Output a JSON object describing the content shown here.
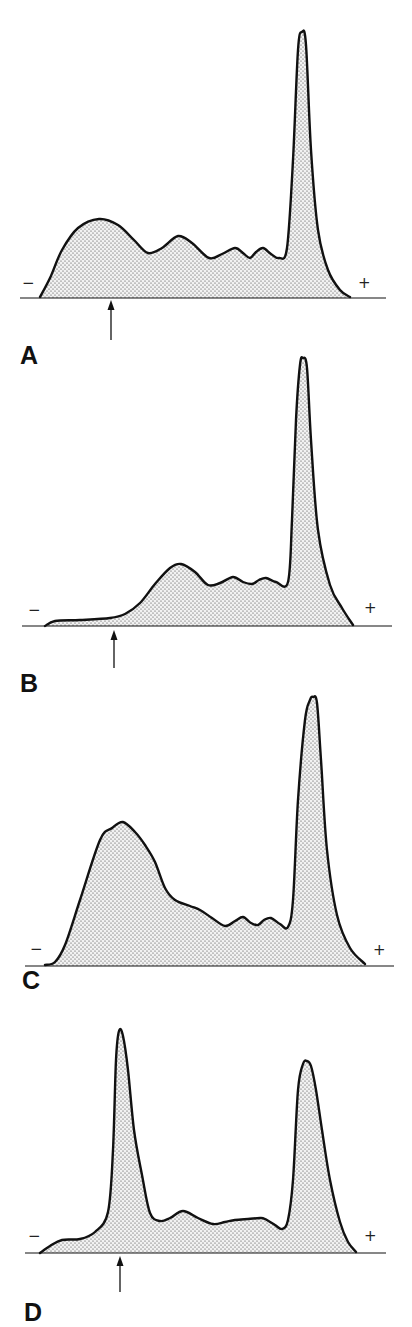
{
  "figure": {
    "type": "electrophoresis-densitometry-tracings",
    "stroke_color": "#111111",
    "fill_dot_color": "#3a3a3a",
    "background": "#ffffff",
    "panels": [
      {
        "label": "A",
        "label_pos": [
          20,
          343
        ],
        "baseline": {
          "y": 298,
          "x1": 20,
          "x2": 386
        },
        "minus": {
          "text": "−",
          "pos": [
            22,
            276
          ]
        },
        "plus": {
          "text": "+",
          "pos": [
            358,
            276
          ]
        },
        "arrow": {
          "x": 111,
          "y_top": 300,
          "y_bottom": 340
        },
        "curve": [
          [
            40,
            297
          ],
          [
            50,
            278
          ],
          [
            62,
            250
          ],
          [
            78,
            228
          ],
          [
            99,
            219
          ],
          [
            118,
            225
          ],
          [
            134,
            240
          ],
          [
            148,
            253
          ],
          [
            162,
            248
          ],
          [
            178,
            236
          ],
          [
            192,
            243
          ],
          [
            209,
            258
          ],
          [
            222,
            254
          ],
          [
            235,
            248
          ],
          [
            243,
            253
          ],
          [
            250,
            258
          ],
          [
            256,
            252
          ],
          [
            263,
            248
          ],
          [
            271,
            254
          ],
          [
            279,
            258
          ],
          [
            287,
            248
          ],
          [
            293,
            160
          ],
          [
            298,
            50
          ],
          [
            302,
            32
          ],
          [
            306,
            45
          ],
          [
            311,
            150
          ],
          [
            318,
            230
          ],
          [
            328,
            270
          ],
          [
            340,
            290
          ],
          [
            350,
            297
          ]
        ]
      },
      {
        "label": "B",
        "label_pos": [
          20,
          671
        ],
        "baseline": {
          "y": 626,
          "x1": 22,
          "x2": 392
        },
        "minus": {
          "text": "−",
          "pos": [
            28,
            603
          ]
        },
        "plus": {
          "text": "+",
          "pos": [
            364,
            601
          ]
        },
        "arrow": {
          "x": 114,
          "y_top": 630,
          "y_bottom": 668
        },
        "curve": [
          [
            45,
            626
          ],
          [
            55,
            621
          ],
          [
            80,
            620
          ],
          [
            110,
            618
          ],
          [
            125,
            614
          ],
          [
            140,
            603
          ],
          [
            155,
            584
          ],
          [
            170,
            568
          ],
          [
            181,
            564
          ],
          [
            195,
            572
          ],
          [
            208,
            585
          ],
          [
            220,
            583
          ],
          [
            233,
            577
          ],
          [
            243,
            582
          ],
          [
            252,
            584
          ],
          [
            259,
            580
          ],
          [
            266,
            578
          ],
          [
            276,
            582
          ],
          [
            288,
            582
          ],
          [
            292,
            520
          ],
          [
            296,
            420
          ],
          [
            300,
            365
          ],
          [
            303,
            358
          ],
          [
            307,
            368
          ],
          [
            311,
            440
          ],
          [
            318,
            530
          ],
          [
            330,
            585
          ],
          [
            342,
            608
          ],
          [
            353,
            625
          ]
        ]
      },
      {
        "label": "C",
        "label_pos": [
          22,
          968
        ],
        "baseline": {
          "y": 966,
          "x1": 25,
          "x2": 394
        },
        "minus": {
          "text": "−",
          "pos": [
            30,
            942
          ]
        },
        "plus": {
          "text": "+",
          "pos": [
            373,
            943
          ]
        },
        "arrow": null,
        "curve": [
          [
            45,
            965
          ],
          [
            55,
            962
          ],
          [
            65,
            945
          ],
          [
            80,
            900
          ],
          [
            100,
            840
          ],
          [
            112,
            828
          ],
          [
            123,
            822
          ],
          [
            135,
            832
          ],
          [
            145,
            845
          ],
          [
            155,
            862
          ],
          [
            165,
            888
          ],
          [
            175,
            900
          ],
          [
            190,
            906
          ],
          [
            200,
            910
          ],
          [
            212,
            918
          ],
          [
            225,
            926
          ],
          [
            235,
            921
          ],
          [
            243,
            917
          ],
          [
            251,
            923
          ],
          [
            258,
            925
          ],
          [
            264,
            920
          ],
          [
            271,
            918
          ],
          [
            280,
            924
          ],
          [
            288,
            927
          ],
          [
            293,
            900
          ],
          [
            298,
            800
          ],
          [
            305,
            720
          ],
          [
            310,
            700
          ],
          [
            313,
            697
          ],
          [
            317,
            703
          ],
          [
            321,
            760
          ],
          [
            327,
            850
          ],
          [
            337,
            915
          ],
          [
            350,
            948
          ],
          [
            365,
            964
          ]
        ]
      },
      {
        "label": "D",
        "label_pos": [
          24,
          1300
        ],
        "baseline": {
          "y": 1253,
          "x1": 25,
          "x2": 386
        },
        "minus": {
          "text": "−",
          "pos": [
            28,
            1229
          ]
        },
        "plus": {
          "text": "+",
          "pos": [
            364,
            1229
          ]
        },
        "arrow": {
          "x": 120,
          "y_top": 1256,
          "y_bottom": 1292
        },
        "curve": [
          [
            40,
            1253
          ],
          [
            50,
            1246
          ],
          [
            62,
            1240
          ],
          [
            80,
            1239
          ],
          [
            95,
            1232
          ],
          [
            108,
            1212
          ],
          [
            113,
            1150
          ],
          [
            116,
            1060
          ],
          [
            119,
            1031
          ],
          [
            123,
            1036
          ],
          [
            128,
            1070
          ],
          [
            134,
            1130
          ],
          [
            142,
            1175
          ],
          [
            150,
            1213
          ],
          [
            160,
            1221
          ],
          [
            170,
            1218
          ],
          [
            183,
            1211
          ],
          [
            198,
            1218
          ],
          [
            213,
            1224
          ],
          [
            225,
            1222
          ],
          [
            235,
            1220
          ],
          [
            248,
            1219
          ],
          [
            260,
            1218
          ],
          [
            265,
            1219
          ],
          [
            275,
            1225
          ],
          [
            282,
            1229
          ],
          [
            288,
            1220
          ],
          [
            293,
            1180
          ],
          [
            298,
            1090
          ],
          [
            303,
            1064
          ],
          [
            307,
            1061
          ],
          [
            311,
            1066
          ],
          [
            316,
            1090
          ],
          [
            322,
            1130
          ],
          [
            330,
            1180
          ],
          [
            340,
            1222
          ],
          [
            348,
            1242
          ],
          [
            356,
            1252
          ]
        ]
      }
    ]
  }
}
